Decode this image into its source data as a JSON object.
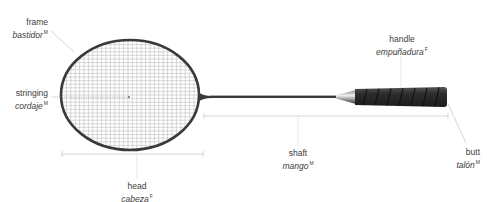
{
  "colors": {
    "frame": "#3a3a3a",
    "strings": "#b8b8b8",
    "handle_grip": "#2a2a2a",
    "leader_lines": "#c4c4c4",
    "text": "#3c3c3c"
  },
  "labels": {
    "frame": {
      "en": "frame",
      "es": "bastidor",
      "gender": "M"
    },
    "stringing": {
      "en": "stringing",
      "es": "cordaje",
      "gender": "M"
    },
    "handle": {
      "en": "handle",
      "es": "empuñadura",
      "gender": "F"
    },
    "shaft": {
      "en": "shaft",
      "es": "mango",
      "gender": "M"
    },
    "butt": {
      "en": "butt",
      "es": "talón",
      "gender": "M"
    },
    "head": {
      "en": "head",
      "es": "cabeza",
      "gender": "F"
    }
  }
}
